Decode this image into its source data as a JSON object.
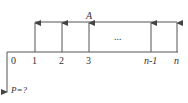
{
  "diagram": {
    "type": "cash-flow-diagram",
    "annuity_label": "A",
    "present_value_label": "P=?",
    "ellipsis": "...",
    "periods": [
      "0",
      "1",
      "2",
      "3",
      "n-1",
      "n"
    ],
    "colors": {
      "line": "#555555",
      "text": "#333333"
    }
  }
}
